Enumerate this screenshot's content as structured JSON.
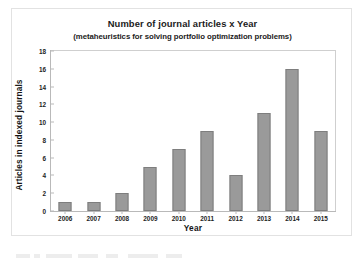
{
  "chart_data": {
    "type": "bar",
    "title": "Number of journal articles x Year",
    "subtitle": "(metaheuristics for solving portfolio optimization problems)",
    "xlabel": "Year",
    "ylabel": "Articles in indexed journals",
    "categories": [
      "2006",
      "2007",
      "2008",
      "2009",
      "2010",
      "2011",
      "2012",
      "2013",
      "2014",
      "2015"
    ],
    "values": [
      1,
      1,
      2,
      5,
      7,
      9,
      4,
      11,
      16,
      9
    ],
    "series": [
      {
        "name": "Articles in indexed journals",
        "values": [
          1,
          1,
          2,
          5,
          7,
          9,
          4,
          11,
          16,
          9
        ]
      }
    ],
    "ylim": [
      0,
      18
    ],
    "ytick_values": [
      0,
      2,
      4,
      6,
      8,
      10,
      12,
      14,
      16,
      18
    ],
    "ytick_labels": [
      "0",
      "2",
      "4",
      "6",
      "8",
      "10",
      "12",
      "14",
      "16",
      "18"
    ],
    "grid": false,
    "legend": "none",
    "bar_color": "#9a9a9a",
    "bar_edge_color": "#7e7e7e",
    "frame_color": "#b9b9b9",
    "background_color": "#ffffff",
    "text_color": "#1b1b1b"
  }
}
